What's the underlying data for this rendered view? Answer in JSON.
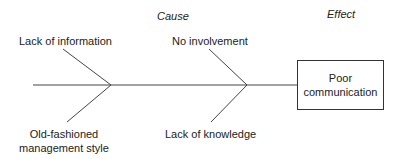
{
  "headers": {
    "cause": "Cause",
    "effect": "Effect"
  },
  "causes": {
    "top_left": "Lack of information",
    "top_right": "No involvement",
    "bottom_left_line1": "Old-fashioned",
    "bottom_left_line2": "management style",
    "bottom_right": "Lack of knowledge"
  },
  "effect": {
    "line1": "Poor",
    "line2": "communication"
  },
  "colors": {
    "line": "#444444",
    "background": "#ffffff"
  }
}
